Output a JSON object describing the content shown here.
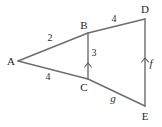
{
  "figure": {
    "type": "geometry-diagram",
    "background_color": "#ffffff",
    "line_color": "#6d6d6d",
    "text_color": "#262626",
    "vertices": [
      {
        "id": "A",
        "label": "A",
        "x": 18,
        "y": 61,
        "label_x": 11,
        "label_y": 65
      },
      {
        "id": "B",
        "label": "B",
        "x": 88,
        "y": 33,
        "label_x": 84,
        "label_y": 29
      },
      {
        "id": "C",
        "label": "C",
        "x": 88,
        "y": 79,
        "label_x": 84,
        "label_y": 91
      },
      {
        "id": "D",
        "label": "D",
        "x": 145,
        "y": 19,
        "label_x": 143,
        "label_y": 13
      },
      {
        "id": "E",
        "label": "E",
        "x": 145,
        "y": 106,
        "label_x": 142,
        "label_y": 120
      }
    ],
    "segments": [
      {
        "id": "AB",
        "from": "A",
        "to": "B"
      },
      {
        "id": "BD",
        "from": "B",
        "to": "D"
      },
      {
        "id": "AC",
        "from": "A",
        "to": "C"
      },
      {
        "id": "CE",
        "from": "C",
        "to": "E"
      },
      {
        "id": "BC",
        "from": "B",
        "to": "C"
      },
      {
        "id": "DE",
        "from": "D",
        "to": "E"
      }
    ],
    "measures": [
      {
        "id": "AB",
        "text": "2",
        "italic": false,
        "x": 50,
        "y": 41
      },
      {
        "id": "BD",
        "text": "4",
        "italic": false,
        "x": 114,
        "y": 22
      },
      {
        "id": "AC",
        "text": "4",
        "italic": false,
        "x": 48,
        "y": 80
      },
      {
        "id": "BC",
        "text": "3",
        "italic": false,
        "x": 94,
        "y": 56
      },
      {
        "id": "DE",
        "text": "f",
        "italic": true,
        "x": 151,
        "y": 67
      },
      {
        "id": "CE",
        "text": "g",
        "italic": true,
        "x": 113,
        "y": 102
      }
    ],
    "parallel_marks": [
      {
        "id": "BC",
        "x": 88,
        "y": 64
      },
      {
        "id": "DE",
        "x": 145,
        "y": 59
      }
    ]
  }
}
